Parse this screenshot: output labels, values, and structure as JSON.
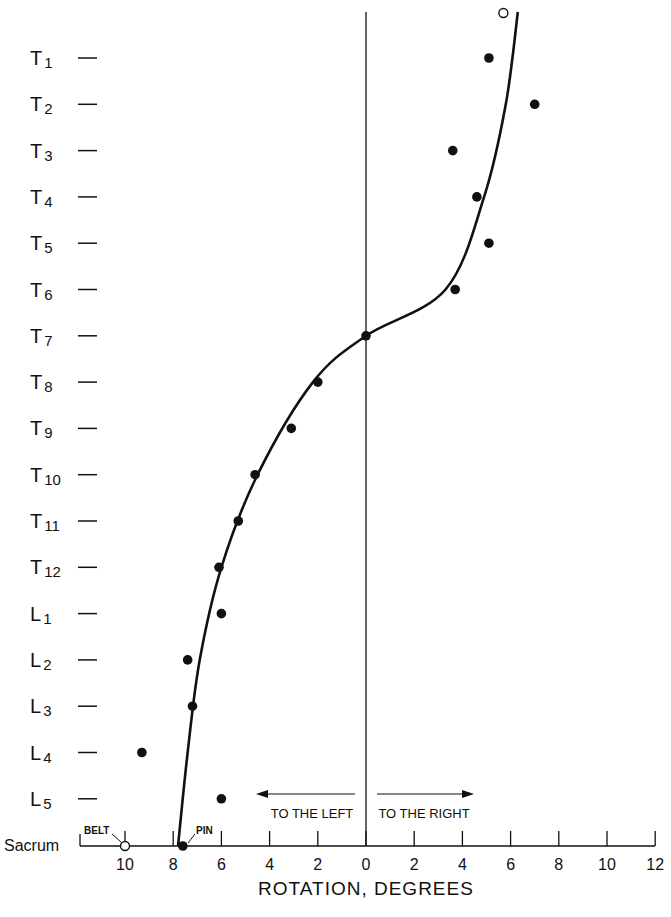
{
  "chart_data": {
    "type": "scatter",
    "title": "",
    "xlabel": "ROTATION, DEGREES",
    "ylabel": "",
    "x_direction_labels": {
      "left": "TO THE LEFT",
      "right": "TO THE RIGHT"
    },
    "x_ticks": [
      -12,
      -10,
      -8,
      -6,
      -4,
      -2,
      0,
      2,
      4,
      6,
      8,
      10,
      12
    ],
    "x_tick_labels": [
      "",
      "10",
      "8",
      "6",
      "4",
      "2",
      "0",
      "2",
      "4",
      "6",
      "8",
      "10",
      "12"
    ],
    "xlim": [
      -12,
      12
    ],
    "categories": [
      "T1",
      "T2",
      "T3",
      "T4",
      "T5",
      "T6",
      "T7",
      "T8",
      "T9",
      "T10",
      "T11",
      "T12",
      "L1",
      "L2",
      "L3",
      "L4",
      "L5",
      "Sacrum"
    ],
    "category_labels": [
      "T1",
      "T2",
      "T3",
      "T4",
      "T5",
      "T6",
      "T7",
      "T8",
      "T9",
      "T10",
      "T11",
      "T12",
      "L1",
      "L2",
      "L3",
      "L4",
      "L5",
      "Sacrum"
    ],
    "series": [
      {
        "name": "measured",
        "marker": "filled-circle",
        "points": [
          {
            "level": "T1",
            "x": 5.1
          },
          {
            "level": "T2",
            "x": 7.0
          },
          {
            "level": "T3",
            "x": 3.6
          },
          {
            "level": "T4",
            "x": 4.6
          },
          {
            "level": "T5",
            "x": 5.1
          },
          {
            "level": "T6",
            "x": 3.7
          },
          {
            "level": "T7",
            "x": 0.0
          },
          {
            "level": "T8",
            "x": -2.0
          },
          {
            "level": "T9",
            "x": -3.1
          },
          {
            "level": "T10",
            "x": -4.6
          },
          {
            "level": "T11",
            "x": -5.3
          },
          {
            "level": "T12",
            "x": -6.1
          },
          {
            "level": "L1",
            "x": -6.0
          },
          {
            "level": "L2",
            "x": -7.4
          },
          {
            "level": "L3",
            "x": -7.2
          },
          {
            "level": "L4",
            "x": -9.3
          },
          {
            "level": "L5",
            "x": -6.0
          },
          {
            "level": "Sacrum",
            "x": -7.6,
            "annotation": "PIN"
          }
        ]
      },
      {
        "name": "reference",
        "marker": "open-circle",
        "points": [
          {
            "level": "above-T1",
            "x": 5.7
          },
          {
            "level": "Sacrum",
            "x": -10.0,
            "annotation": "BELT"
          }
        ]
      },
      {
        "name": "fitted-curve",
        "marker": "line",
        "points": [
          {
            "level": "top",
            "x": 6.3
          },
          {
            "level": "T2",
            "x": 5.8
          },
          {
            "level": "T4",
            "x": 4.9
          },
          {
            "level": "T6",
            "x": 3.3
          },
          {
            "level": "T7",
            "x": 0.0
          },
          {
            "level": "T8",
            "x": -2.2
          },
          {
            "level": "T10",
            "x": -4.5
          },
          {
            "level": "T12",
            "x": -6.0
          },
          {
            "level": "L2",
            "x": -6.9
          },
          {
            "level": "L4",
            "x": -7.4
          },
          {
            "level": "Sacrum",
            "x": -7.8
          }
        ]
      }
    ],
    "annotations": [
      "BELT",
      "PIN"
    ],
    "grid": false,
    "legend": "none"
  }
}
